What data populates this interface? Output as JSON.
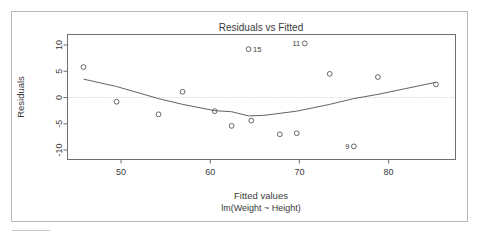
{
  "window": {
    "frame_visible": true
  },
  "chart_data": {
    "type": "scatter",
    "title": "Residuals vs Fitted",
    "xlabel": "Fitted values",
    "sublabel": "lm(Weight ~ Height)",
    "ylabel": "Residuals",
    "xlim": [
      44.0,
      87.5
    ],
    "ylim": [
      -11.8,
      12.0
    ],
    "xticks": [
      50,
      60,
      70,
      80
    ],
    "xtick_labels": [
      "50",
      "60",
      "70",
      "80"
    ],
    "yticks": [
      10,
      5,
      0,
      -5,
      -10
    ],
    "ytick_labels": [
      "10",
      "5",
      "0",
      "-5",
      "-10"
    ],
    "grid": false,
    "legend": null,
    "zero_reference_line": 0,
    "marker": "open-circle",
    "points": [
      {
        "x": 45.8,
        "y": 5.8,
        "label": null
      },
      {
        "x": 49.5,
        "y": -0.8,
        "label": null
      },
      {
        "x": 54.2,
        "y": -3.2,
        "label": null
      },
      {
        "x": 56.9,
        "y": 1.1,
        "label": null
      },
      {
        "x": 60.5,
        "y": -2.6,
        "label": null
      },
      {
        "x": 62.4,
        "y": -5.4,
        "label": null
      },
      {
        "x": 64.3,
        "y": 9.2,
        "label": "15",
        "label_side": "right"
      },
      {
        "x": 64.6,
        "y": -4.4,
        "label": null
      },
      {
        "x": 67.8,
        "y": -7.0,
        "label": null
      },
      {
        "x": 69.7,
        "y": -6.8,
        "label": null
      },
      {
        "x": 70.6,
        "y": 10.3,
        "label": "11",
        "label_side": "left"
      },
      {
        "x": 73.4,
        "y": 4.5,
        "label": null
      },
      {
        "x": 76.1,
        "y": -9.3,
        "label": "9",
        "label_side": "left"
      },
      {
        "x": 78.8,
        "y": 3.9,
        "label": null
      },
      {
        "x": 85.3,
        "y": 2.5,
        "label": null
      }
    ],
    "lowess_curve": [
      {
        "x": 45.8,
        "y": 3.5
      },
      {
        "x": 49.5,
        "y": 2.1
      },
      {
        "x": 54.2,
        "y": -0.2
      },
      {
        "x": 56.9,
        "y": -1.3
      },
      {
        "x": 60.5,
        "y": -2.5
      },
      {
        "x": 62.4,
        "y": -2.7
      },
      {
        "x": 64.3,
        "y": -3.5
      },
      {
        "x": 66.0,
        "y": -3.4
      },
      {
        "x": 69.7,
        "y": -2.6
      },
      {
        "x": 73.4,
        "y": -1.3
      },
      {
        "x": 76.1,
        "y": -0.2
      },
      {
        "x": 78.8,
        "y": 0.6
      },
      {
        "x": 85.3,
        "y": 2.9
      }
    ]
  }
}
